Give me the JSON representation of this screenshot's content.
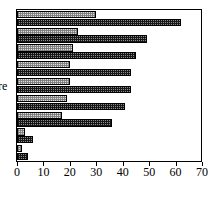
{
  "chart_data": {
    "type": "bar",
    "orientation": "horizontal",
    "title": "",
    "xlabel": "",
    "ylabel": "re",
    "xlim": [
      0,
      70
    ],
    "xticks": [
      0,
      10,
      20,
      30,
      40,
      50,
      60,
      70
    ],
    "grid": false,
    "legend": "none",
    "categories": [
      "1",
      "2",
      "3",
      "4",
      "5",
      "6",
      "7",
      "8",
      "9"
    ],
    "series": [
      {
        "name": "light",
        "values": [
          30,
          23,
          21,
          20,
          20,
          19,
          17,
          3,
          2
        ]
      },
      {
        "name": "dark",
        "values": [
          62,
          49,
          45,
          43,
          43,
          41,
          36,
          6,
          4
        ]
      }
    ],
    "colors": {
      "light": "#dedede",
      "dark": "#8c8c8c",
      "axis": "#000000"
    }
  },
  "axis": {
    "tick_labels": [
      "0",
      "10",
      "20",
      "30",
      "40",
      "50",
      "60",
      "70"
    ],
    "y_title": "re"
  }
}
